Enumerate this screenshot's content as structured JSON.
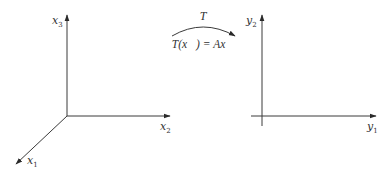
{
  "diagram": {
    "type": "linear-transformation",
    "domain_space": {
      "name": "R3",
      "axes": [
        {
          "id": "x1",
          "base": "x",
          "sub": "1",
          "direction": "diagonal-down-left"
        },
        {
          "id": "x2",
          "base": "x",
          "sub": "2",
          "direction": "right"
        },
        {
          "id": "x3",
          "base": "x",
          "sub": "3",
          "direction": "up"
        }
      ]
    },
    "codomain_space": {
      "name": "R2",
      "axes": [
        {
          "id": "y1",
          "base": "y",
          "sub": "1",
          "direction": "right"
        },
        {
          "id": "y2",
          "base": "y",
          "sub": "2",
          "direction": "up"
        }
      ]
    },
    "mapping": {
      "name": "T",
      "formula": "T(x⃗) = Ax⃗",
      "formula_parts": {
        "lhs": "T(",
        "var": "x⃗",
        "close": ")",
        "eq": " = ",
        "rhs": "Ax⃗"
      }
    },
    "colors": {
      "line": "#3a3a3a",
      "text": "#333333",
      "background": "#ffffff"
    }
  }
}
